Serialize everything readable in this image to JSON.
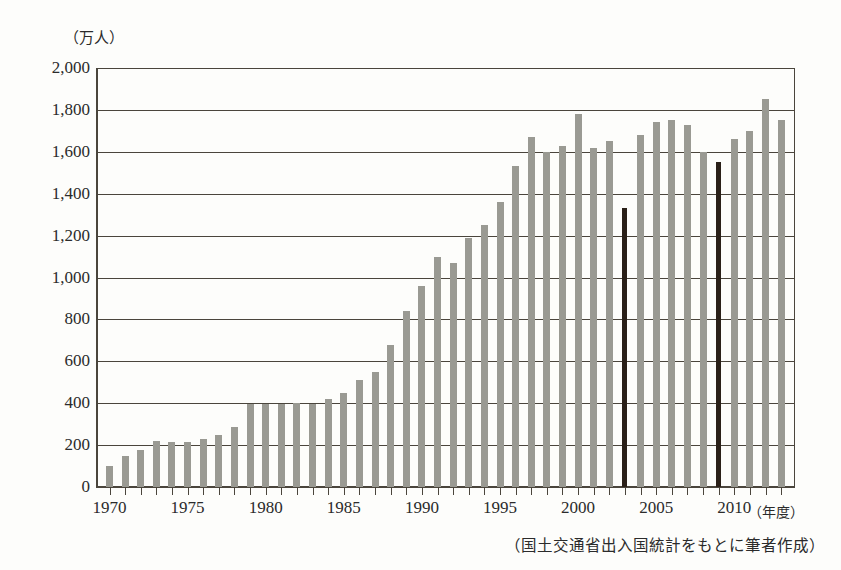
{
  "chart_data": {
    "type": "bar",
    "title": "",
    "unit_label": "（万人）",
    "xlabel": "（年度）",
    "ylabel": "",
    "ylim": [
      0,
      2000
    ],
    "ytick_step": 200,
    "yticks": [
      0,
      200,
      400,
      600,
      800,
      1000,
      1200,
      1400,
      1600,
      1800,
      2000
    ],
    "ytick_labels": [
      "0",
      "200",
      "400",
      "600",
      "800",
      "1,000",
      "1,200",
      "1,400",
      "1,600",
      "1,800",
      "2,000"
    ],
    "xtick_labels": [
      "1970",
      "1975",
      "1980",
      "1985",
      "1990",
      "1995",
      "2000",
      "2005",
      "2010"
    ],
    "xtick_values": [
      1970,
      1975,
      1980,
      1985,
      1990,
      1995,
      2000,
      2005,
      2010
    ],
    "grid": true,
    "legend": "none",
    "bar_color": "#9a9a93",
    "highlight_color": "#2a2018",
    "highlight_years": [
      2003,
      2009
    ],
    "categories": [
      1970,
      1971,
      1972,
      1973,
      1974,
      1975,
      1976,
      1977,
      1978,
      1979,
      1980,
      1981,
      1982,
      1983,
      1984,
      1985,
      1986,
      1987,
      1988,
      1989,
      1990,
      1991,
      1992,
      1993,
      1994,
      1995,
      1996,
      1997,
      1998,
      1999,
      2000,
      2001,
      2002,
      2003,
      2004,
      2005,
      2006,
      2007,
      2008,
      2009,
      2010,
      2011,
      2012,
      2013
    ],
    "values": [
      100,
      150,
      175,
      220,
      215,
      215,
      230,
      250,
      285,
      395,
      395,
      395,
      400,
      395,
      420,
      450,
      510,
      550,
      680,
      840,
      960,
      1100,
      1070,
      1190,
      1250,
      1360,
      1530,
      1670,
      1600,
      1630,
      1780,
      1620,
      1650,
      1330,
      1680,
      1740,
      1750,
      1730,
      1600,
      1550,
      1660,
      1700,
      1850,
      1750
    ],
    "source_note": "（国土交通省出入国統計をもとに筆者作成）"
  }
}
